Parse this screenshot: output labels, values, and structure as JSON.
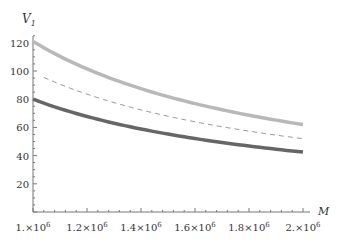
{
  "chart_data": {
    "type": "line",
    "title": "",
    "xlabel": "M",
    "ylabel": "V1",
    "xlim": [
      1000000,
      2000000
    ],
    "ylim": [
      0,
      125
    ],
    "x_ticks": [
      "1.×10^6",
      "1.2×10^6",
      "1.4×10^6",
      "1.6×10^6",
      "1.8×10^6",
      "2.×10^6"
    ],
    "y_ticks": [
      "20",
      "40",
      "60",
      "80",
      "100",
      "120"
    ],
    "x": [
      1000000,
      1200000,
      1400000,
      1600000,
      1800000,
      2000000
    ],
    "series": [
      {
        "name": "upper",
        "style": "thick light gray",
        "color": "#b8b8b8",
        "values": [
          121,
          103,
          90,
          79.5,
          70,
          62
        ]
      },
      {
        "name": "middle",
        "style": "dashed gray",
        "color": "#999999",
        "values": [
          99,
          85,
          74,
          65.5,
          58,
          52
        ]
      },
      {
        "name": "lower",
        "style": "thick dark gray",
        "color": "#666666",
        "values": [
          80,
          68.5,
          60,
          53,
          47.5,
          42.5
        ]
      }
    ]
  }
}
